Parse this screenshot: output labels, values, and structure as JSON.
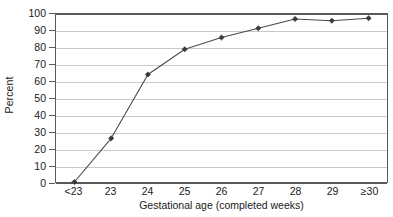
{
  "chart_data": {
    "type": "line",
    "title": "",
    "subtitle": "",
    "xlabel": "Gestational age (completed weeks)",
    "ylabel": "Percent",
    "categories": [
      "<23",
      "23",
      "24",
      "25",
      "26",
      "27",
      "28",
      "29",
      "≥30"
    ],
    "values": [
      0,
      26,
      64,
      79,
      86,
      91.5,
      97,
      96,
      97.5
    ],
    "series": [
      {
        "name": "Percent",
        "values": [
          0,
          26,
          64,
          79,
          86,
          91.5,
          97,
          96,
          97.5
        ]
      }
    ],
    "ylim": [
      0,
      100
    ],
    "ytick_labels": [
      "0",
      "10",
      "20",
      "30",
      "40",
      "50",
      "60",
      "70",
      "80",
      "90",
      "100"
    ],
    "ytick_values": [
      0,
      10,
      20,
      30,
      40,
      50,
      60,
      70,
      80,
      90,
      100
    ],
    "grid": true,
    "grid_orientation": "horizontal",
    "legend": false,
    "legend_position": "none",
    "marker": "diamond",
    "annotations": []
  },
  "style": {
    "line_color": "#4a4a4a",
    "marker_color": "#3a3a3a",
    "gridline_color": "#c9c9c9",
    "axis_color": "#5a5a5a",
    "text_color": "#1a1a1a",
    "plot_background": "#ffffff"
  }
}
